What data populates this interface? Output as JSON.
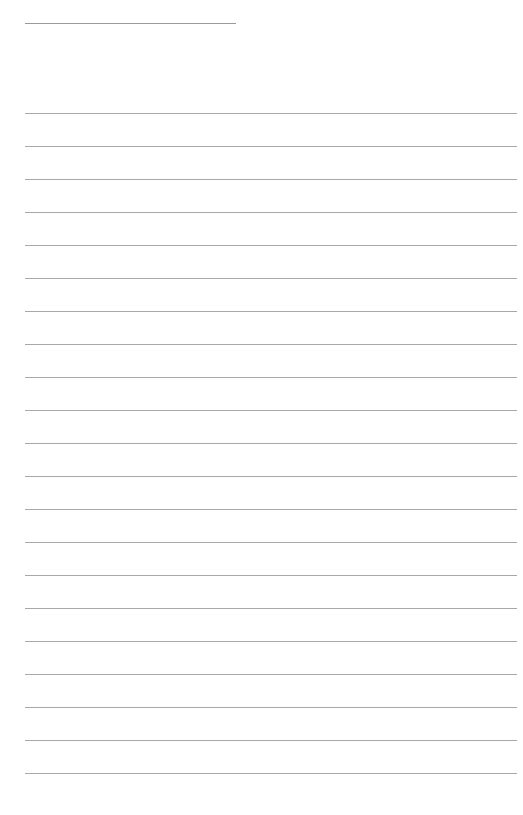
{
  "page": {
    "type": "lined-paper",
    "background_color": "#ffffff",
    "line_color": "#a8a8a8",
    "title_line": {
      "x": 25,
      "y": 23,
      "width": 211,
      "text": ""
    },
    "rules": {
      "count": 21,
      "first_y": 113,
      "spacing": 33,
      "x": 25,
      "width": 492
    },
    "lines": [
      "",
      "",
      "",
      "",
      "",
      "",
      "",
      "",
      "",
      "",
      "",
      "",
      "",
      "",
      "",
      "",
      "",
      "",
      "",
      "",
      ""
    ]
  }
}
